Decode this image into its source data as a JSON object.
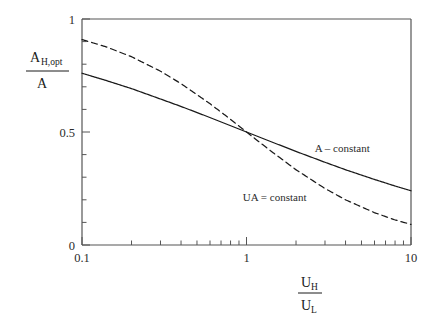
{
  "chart_data": {
    "type": "line",
    "title": "",
    "xlabel": "U_H / U_L",
    "ylabel": "A_H,opt / A",
    "xscale": "log",
    "yscale": "linear",
    "xlim": [
      0.1,
      10
    ],
    "ylim": [
      0,
      1
    ],
    "grid": false,
    "legend_position": "inline-right",
    "xticks": [
      {
        "value": 0.1,
        "label": "0.1"
      },
      {
        "value": 1,
        "label": "1"
      },
      {
        "value": 10,
        "label": "10"
      }
    ],
    "yticks": [
      {
        "value": 0,
        "label": "0"
      },
      {
        "value": 0.5,
        "label": "0.5"
      },
      {
        "value": 1,
        "label": "1"
      }
    ],
    "series": [
      {
        "name": "A - constant",
        "style": "solid",
        "color": "#1a1a1a",
        "x": [
          0.1,
          0.14,
          0.2,
          0.3,
          0.4,
          0.6,
          0.8,
          1.0,
          1.4,
          2.0,
          3.0,
          4.0,
          6.0,
          8.0,
          10.0
        ],
        "y": [
          0.76,
          0.728,
          0.692,
          0.646,
          0.613,
          0.564,
          0.528,
          0.5,
          0.458,
          0.414,
          0.366,
          0.333,
          0.29,
          0.261,
          0.24
        ]
      },
      {
        "name": "UA = constant",
        "style": "dashed",
        "color": "#1a1a1a",
        "x": [
          0.1,
          0.14,
          0.2,
          0.3,
          0.4,
          0.6,
          0.8,
          1.0,
          1.4,
          2.0,
          3.0,
          4.0,
          6.0,
          8.0,
          10.0
        ],
        "y": [
          0.909,
          0.877,
          0.833,
          0.769,
          0.714,
          0.625,
          0.556,
          0.5,
          0.417,
          0.333,
          0.25,
          0.2,
          0.143,
          0.111,
          0.091
        ]
      }
    ],
    "annotations": [
      {
        "text": "A – constant",
        "x": 2.6,
        "y": 0.41
      },
      {
        "text": "UA = constant",
        "x": 0.95,
        "y": 0.195
      }
    ]
  },
  "axis_labels": {
    "y_numerator_main": "A",
    "y_numerator_sub": "H,opt",
    "y_denominator": "A",
    "x_numerator_main": "U",
    "x_numerator_sub": "H",
    "x_denominator_main": "U",
    "x_denominator_sub": "L"
  }
}
